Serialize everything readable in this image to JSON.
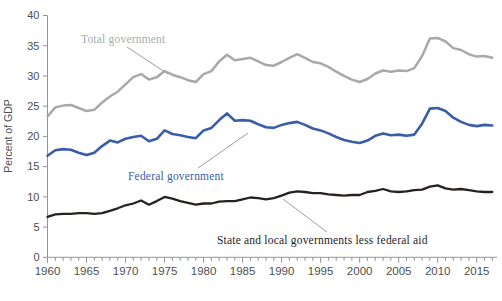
{
  "figure": {
    "background": "#ffffff",
    "axis_color": "#929497",
    "tick_label_color": "#4d4f53"
  },
  "chart_data": {
    "type": "line",
    "title": "",
    "xlabel": "",
    "ylabel": "Percent of GDP",
    "xlim": [
      1960,
      2017.6
    ],
    "ylim": [
      0,
      40
    ],
    "yticks": [
      0,
      5,
      10,
      15,
      20,
      25,
      30,
      35,
      40
    ],
    "xticks": [
      1960,
      1965,
      1970,
      1975,
      1980,
      1985,
      1990,
      1995,
      2000,
      2005,
      2010,
      2015
    ],
    "minor_xtick_step": 1,
    "grid": false,
    "legend_position": "inline-annotations",
    "x": [
      1960,
      1961,
      1962,
      1963,
      1964,
      1965,
      1966,
      1967,
      1968,
      1969,
      1970,
      1971,
      1972,
      1973,
      1974,
      1975,
      1976,
      1977,
      1978,
      1979,
      1980,
      1981,
      1982,
      1983,
      1984,
      1985,
      1986,
      1987,
      1988,
      1989,
      1990,
      1991,
      1992,
      1993,
      1994,
      1995,
      1996,
      1997,
      1998,
      1999,
      2000,
      2001,
      2002,
      2003,
      2004,
      2005,
      2006,
      2007,
      2008,
      2009,
      2010,
      2011,
      2012,
      2013,
      2014,
      2015,
      2016,
      2017
    ],
    "series": [
      {
        "name": "Total government",
        "color": "#a7a9ac",
        "width": 2.5,
        "values": [
          23.3,
          24.8,
          25.1,
          25.2,
          24.7,
          24.2,
          24.4,
          25.6,
          26.6,
          27.4,
          28.6,
          29.8,
          30.3,
          29.4,
          29.8,
          30.8,
          30.2,
          29.8,
          29.3,
          29.0,
          30.3,
          30.8,
          32.4,
          33.5,
          32.6,
          32.8,
          33.0,
          32.4,
          31.8,
          31.7,
          32.3,
          33.0,
          33.6,
          33.0,
          32.3,
          32.1,
          31.5,
          30.7,
          30.0,
          29.4,
          29.0,
          29.5,
          30.4,
          30.9,
          30.7,
          30.9,
          30.8,
          31.3,
          33.3,
          36.2,
          36.3,
          35.7,
          34.6,
          34.3,
          33.6,
          33.2,
          33.3,
          33.0
        ]
      },
      {
        "name": "Federal government",
        "color": "#3a5da9",
        "width": 2.6,
        "values": [
          16.8,
          17.7,
          17.9,
          17.8,
          17.3,
          16.9,
          17.3,
          18.4,
          19.3,
          19.0,
          19.6,
          19.9,
          20.1,
          19.2,
          19.6,
          21.0,
          20.4,
          20.2,
          19.9,
          19.7,
          21.0,
          21.4,
          22.7,
          23.8,
          22.6,
          22.7,
          22.6,
          22.0,
          21.5,
          21.4,
          21.9,
          22.2,
          22.4,
          21.9,
          21.3,
          21.0,
          20.5,
          19.9,
          19.4,
          19.1,
          18.9,
          19.3,
          20.1,
          20.5,
          20.2,
          20.3,
          20.1,
          20.3,
          22.1,
          24.6,
          24.7,
          24.2,
          23.1,
          22.4,
          21.9,
          21.7,
          21.9,
          21.8
        ]
      },
      {
        "name": "State and local governments less federal aid",
        "color": "#27221f",
        "width": 2.3,
        "values": [
          6.7,
          7.1,
          7.2,
          7.2,
          7.3,
          7.3,
          7.2,
          7.3,
          7.7,
          8.1,
          8.6,
          8.9,
          9.4,
          8.7,
          9.3,
          10.0,
          9.7,
          9.3,
          9.0,
          8.7,
          8.9,
          8.9,
          9.2,
          9.3,
          9.3,
          9.6,
          9.9,
          9.8,
          9.6,
          9.8,
          10.2,
          10.7,
          10.9,
          10.8,
          10.6,
          10.6,
          10.4,
          10.3,
          10.2,
          10.3,
          10.3,
          10.8,
          11.0,
          11.3,
          10.9,
          10.8,
          10.9,
          11.1,
          11.2,
          11.7,
          11.9,
          11.4,
          11.2,
          11.3,
          11.1,
          10.9,
          10.8,
          10.8
        ]
      }
    ],
    "annotations": [
      {
        "label": "Total government",
        "series": 0,
        "line": {
          "x1": 127,
          "y1": 47,
          "x2": 168,
          "y2": 74
        }
      },
      {
        "label": "Federal government",
        "series": 1,
        "line": {
          "x1": 198,
          "y1": 168,
          "x2": 248,
          "y2": 133
        }
      },
      {
        "label": "State and local governments less federal aid",
        "series": 2,
        "line": {
          "x1": 283,
          "y1": 199,
          "x2": 327,
          "y2": 232
        }
      }
    ]
  }
}
